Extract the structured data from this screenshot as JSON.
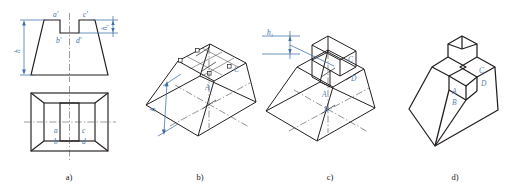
{
  "figure": {
    "background": "#ffffff",
    "ink_color": "#231f20",
    "annotation_color": "#3d6fa8",
    "centerline_color": "#4a4a4a"
  },
  "panels": [
    {
      "id": "a",
      "caption": "a)",
      "description": "Two orthographic views: front view (trapezoid with notch) above, top view (rectangle with trapezoidal faces and central slot) below",
      "dimensions": [
        {
          "name": "h",
          "label": "h",
          "sub": "",
          "position": "left of front view"
        },
        {
          "name": "h1",
          "label": "h",
          "sub": "1",
          "position": "right of front view"
        }
      ],
      "point_labels": [
        {
          "name": "a-prime",
          "text": "a",
          "prime": "′",
          "view": "front",
          "position": "top-left of notch"
        },
        {
          "name": "c-prime",
          "text": "c",
          "prime": "′",
          "view": "front",
          "position": "top-right of notch"
        },
        {
          "name": "b-prime",
          "text": "b",
          "prime": "′",
          "view": "front",
          "position": "bottom-left of notch"
        },
        {
          "name": "d-prime",
          "text": "d",
          "prime": "′",
          "view": "front",
          "position": "bottom-right of notch"
        },
        {
          "name": "a",
          "text": "a",
          "prime": "",
          "view": "top",
          "position": "left slot edge"
        },
        {
          "name": "b",
          "text": "b",
          "prime": "",
          "view": "top",
          "position": "left slot lower"
        },
        {
          "name": "c",
          "text": "c",
          "prime": "",
          "view": "top",
          "position": "right slot edge"
        },
        {
          "name": "d",
          "text": "d",
          "prime": "",
          "view": "top",
          "position": "right slot lower"
        }
      ]
    },
    {
      "id": "b",
      "caption": "b)",
      "description": "Isometric frustum with construction grid on top face and axis centerlines",
      "dimensions": [
        {
          "name": "h",
          "label": "h",
          "sub": "",
          "position": "left vertical of frustum"
        }
      ],
      "point_labels": [
        {
          "name": "A",
          "text": "A",
          "prime": ""
        },
        {
          "name": "C",
          "text": "C",
          "prime": ""
        }
      ]
    },
    {
      "id": "c",
      "caption": "c)",
      "description": "Isometric frustum with slot block constructed on top face, height dimension h1 projected",
      "dimensions": [
        {
          "name": "h1",
          "label": "h",
          "sub": "1",
          "position": "upper-left projection"
        }
      ],
      "point_labels": [
        {
          "name": "A",
          "text": "A",
          "prime": ""
        },
        {
          "name": "B",
          "text": "B",
          "prime": ""
        },
        {
          "name": "C",
          "text": "C",
          "prime": ""
        },
        {
          "name": "D",
          "text": "D",
          "prime": ""
        }
      ]
    },
    {
      "id": "d",
      "caption": "d)",
      "description": "Finished isometric solid: truncated pyramid with rectangular slot cut through the top",
      "dimensions": [],
      "point_labels": [
        {
          "name": "A",
          "text": "A",
          "prime": ""
        },
        {
          "name": "B",
          "text": "B",
          "prime": ""
        },
        {
          "name": "C",
          "text": "C",
          "prime": ""
        },
        {
          "name": "D",
          "text": "D",
          "prime": ""
        }
      ]
    }
  ]
}
